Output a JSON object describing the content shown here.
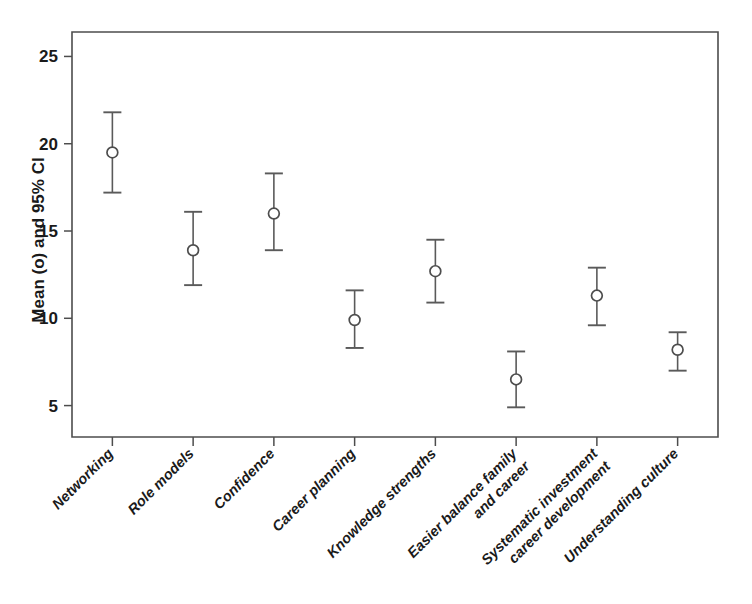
{
  "chart_data": {
    "type": "scatter",
    "title": "",
    "xlabel": "",
    "ylabel": "Mean (o) and 95% CI",
    "ylim": [
      3.2,
      26.4
    ],
    "yticks": [
      5,
      10,
      15,
      20,
      25
    ],
    "ytick_labels": [
      "5",
      "10",
      "15",
      "20",
      "25"
    ],
    "grid": false,
    "legend": "none",
    "marker_style": "open-circle",
    "error_bar_type": "95% confidence interval",
    "categories": [
      "Networking",
      "Role models",
      "Confidence",
      "Career planning",
      "Knowledge strengths",
      "Easier balance family and career",
      "Systematic investment career development",
      "Understanding culture"
    ],
    "category_label_lines": [
      [
        "Networking"
      ],
      [
        "Role models"
      ],
      [
        "Confidence"
      ],
      [
        "Career planning"
      ],
      [
        "Knowledge strengths"
      ],
      [
        "Easier balance family",
        "and career"
      ],
      [
        "Systematic investment",
        "career development"
      ],
      [
        "Understanding culture"
      ]
    ],
    "values": [
      19.5,
      13.9,
      16.0,
      9.9,
      12.7,
      6.5,
      11.3,
      8.2
    ],
    "ci_lower": [
      17.2,
      11.9,
      13.9,
      8.3,
      10.9,
      4.9,
      9.6,
      7.0
    ],
    "ci_upper": [
      21.8,
      16.1,
      18.3,
      11.6,
      14.5,
      8.1,
      12.9,
      9.2
    ],
    "colors": {
      "axis": "#4d4d4d",
      "marker_edge": "#4d4d4d",
      "marker_fill": "#ffffff",
      "error_bar": "#5a5a5a",
      "text": "#1a1a1a",
      "background": "#ffffff"
    }
  }
}
